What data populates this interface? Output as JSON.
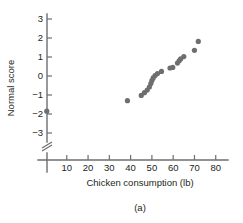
{
  "figure": {
    "caption": "(a)",
    "point_color": "#6e6e6e",
    "axis_color": "#6d6e71",
    "background": "#ffffff"
  },
  "chart_data": {
    "type": "scatter",
    "title": "",
    "subtitle": "",
    "xlabel": "Chicken consumption (lb)",
    "ylabel": "Normal score",
    "xlim": [
      0,
      85
    ],
    "ylim": [
      -3.6,
      3.4
    ],
    "xticks": [
      10,
      20,
      30,
      40,
      50,
      60,
      70,
      80
    ],
    "xticklabels": [
      "10",
      "20",
      "30",
      "40",
      "50",
      "60",
      "70",
      "80"
    ],
    "yticks": [
      3,
      2,
      1,
      0,
      -1,
      -2,
      -3
    ],
    "yticklabels": [
      "3",
      "2",
      "1",
      "0",
      "−1",
      "−2",
      "−3"
    ],
    "grid": false,
    "legend": null,
    "axis_break": {
      "axis": "y",
      "symbol": "zigzag",
      "below_value": -3.4
    },
    "series": [
      {
        "name": "Chicken consumption normal probability plot",
        "marker": "filled-circle",
        "color": "#6e6e6e",
        "points": [
          {
            "x": 0.6,
            "y": -1.85
          },
          {
            "x": 38.5,
            "y": -1.3
          },
          {
            "x": 45.0,
            "y": -1.02
          },
          {
            "x": 46.5,
            "y": -0.88
          },
          {
            "x": 47.8,
            "y": -0.74
          },
          {
            "x": 48.8,
            "y": -0.58
          },
          {
            "x": 49.5,
            "y": -0.4
          },
          {
            "x": 50.0,
            "y": -0.24
          },
          {
            "x": 50.6,
            "y": -0.1
          },
          {
            "x": 51.5,
            "y": 0.02
          },
          {
            "x": 52.6,
            "y": 0.13
          },
          {
            "x": 54.5,
            "y": 0.24
          },
          {
            "x": 58.5,
            "y": 0.42
          },
          {
            "x": 59.8,
            "y": 0.45
          },
          {
            "x": 62.0,
            "y": 0.68
          },
          {
            "x": 62.8,
            "y": 0.8
          },
          {
            "x": 63.5,
            "y": 0.9
          },
          {
            "x": 65.0,
            "y": 1.02
          },
          {
            "x": 70.0,
            "y": 1.35
          },
          {
            "x": 71.8,
            "y": 1.82
          }
        ]
      }
    ]
  },
  "geometry": {
    "x_px_at_0": 45.5,
    "x_px_per_unit": 2.128,
    "y_px_at_0": 76.0,
    "y_px_per_unit": 19.0,
    "axis_x_start": 38,
    "axis_x_end": 228,
    "axis_y_top": 14,
    "axis_y_bottom": 142,
    "x_axis_y": 160,
    "y_axis_x": 47,
    "break_y": 149,
    "marker_radius": 2.6
  }
}
